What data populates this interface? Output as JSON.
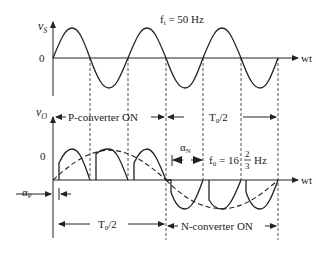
{
  "diagram": {
    "input_plot": {
      "y_axis_label": "v",
      "y_axis_sub": "S",
      "zero_label": "0",
      "x_axis_label": "wt",
      "frequency_label": "f",
      "frequency_sub": "i",
      "frequency_value": " = 50 Hz"
    },
    "output_plot": {
      "y_axis_label": "v",
      "y_axis_sub": "O",
      "zero_label": "0",
      "x_axis_label": "wt",
      "p_converter_label": "P-converter ON",
      "n_converter_label": "N-converter ON",
      "half_period_top": "T",
      "half_period_top_sub": "0",
      "half_period_top_rest": "/2",
      "half_period_bottom": "T",
      "half_period_bottom_sub": "0",
      "half_period_bottom_rest": "/2",
      "alpha_p": "α",
      "alpha_p_sub": "P",
      "alpha_n": "α",
      "alpha_n_sub": "N",
      "f0_label": "f",
      "f0_sub": "0",
      "f0_value": " = 16",
      "f0_frac_num": "2",
      "f0_frac_den": "3",
      "f0_unit": "Hz"
    },
    "colors": {
      "stroke": "#222222",
      "background": "#ffffff"
    }
  }
}
